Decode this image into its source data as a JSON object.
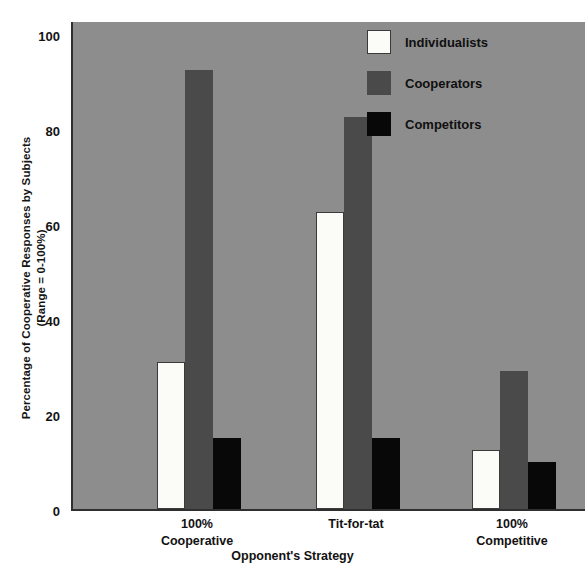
{
  "chart_data": {
    "type": "bar",
    "title": "",
    "xlabel": "Opponent's Strategy",
    "ylabel": "Percentage of Cooperative Responses by Subjects",
    "ylabel_line2": "(Range = 0-100%)",
    "categories": [
      "100% Cooperative",
      "Tit-for-tat",
      "100% Competitive"
    ],
    "category_lines": [
      [
        "100%",
        "Cooperative"
      ],
      [
        "Tit-for-tat",
        ""
      ],
      [
        "100%",
        "Competitive"
      ]
    ],
    "series": [
      {
        "name": "Individualists",
        "color": "#fbfbf8",
        "values": [
          31,
          62.5,
          12.5
        ]
      },
      {
        "name": "Cooperators",
        "color": "#4a4a4a",
        "values": [
          92.5,
          82.5,
          29
        ]
      },
      {
        "name": "Competitors",
        "color": "#080808",
        "values": [
          15,
          15,
          10
        ]
      }
    ],
    "ylim": [
      0,
      103
    ],
    "yticks": [
      0,
      20,
      40,
      60,
      80,
      100
    ],
    "ytick_labels": [
      "0",
      "20",
      "40",
      "60",
      "80",
      "100"
    ],
    "grid": false,
    "legend_position": "top-right-inside",
    "plot_background": "#8d8d8d",
    "axis_color": "#2f2f2f"
  },
  "legend": {
    "items": [
      {
        "label": "Individualists"
      },
      {
        "label": "Cooperators"
      },
      {
        "label": "Competitors"
      }
    ]
  }
}
